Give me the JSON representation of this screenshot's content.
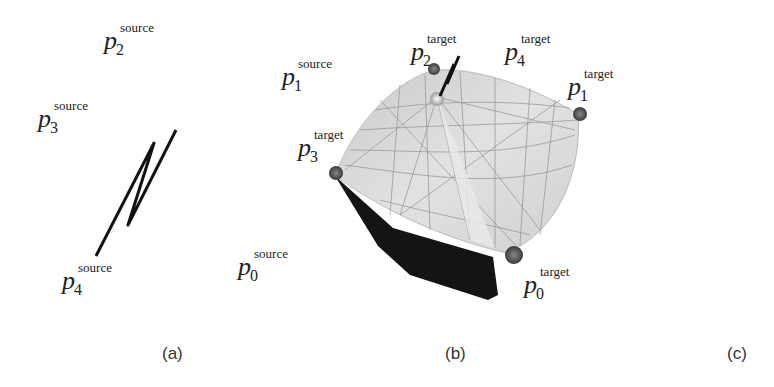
{
  "figure": {
    "panels": [
      {
        "id": "a",
        "caption": "(a)"
      },
      {
        "id": "b",
        "caption": "(b)"
      },
      {
        "id": "c",
        "caption": "(c)"
      }
    ],
    "labels": {
      "p0_source": {
        "base": "p",
        "sub": "0",
        "sup": "source"
      },
      "p1_source": {
        "base": "p",
        "sub": "1",
        "sup": "source"
      },
      "p2_source": {
        "base": "p",
        "sub": "2",
        "sup": "source"
      },
      "p3_source": {
        "base": "p",
        "sub": "3",
        "sup": "source"
      },
      "p4_source": {
        "base": "p",
        "sub": "4",
        "sup": "source"
      },
      "p0_target": {
        "base": "p",
        "sub": "0",
        "sup": "target"
      },
      "p1_target": {
        "base": "p",
        "sub": "1",
        "sup": "target"
      },
      "p2_target": {
        "base": "p",
        "sub": "2",
        "sup": "target"
      },
      "p3_target": {
        "base": "p",
        "sub": "3",
        "sup": "target"
      },
      "p4_target": {
        "base": "p",
        "sub": "4",
        "sup": "target"
      }
    }
  }
}
